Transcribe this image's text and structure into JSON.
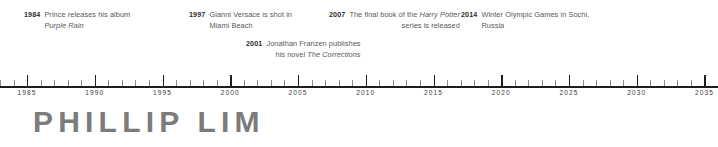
{
  "headline": "PHILLIP LIM",
  "colors": {
    "axis": "#1d1d1d",
    "major_tick": "#1d1d1d",
    "minor_tick": "#8c8c8c",
    "year_text": "#2b2b2b",
    "body_text": "#56585a",
    "headline": "#7b7b7b",
    "background": "#ffffff"
  },
  "annotations": [
    {
      "year": "1984",
      "line1": "Prince releases his album",
      "line2": "Purple Rain",
      "line2_italic": true,
      "align": "left",
      "row": 0,
      "x": 24,
      "y": 10
    },
    {
      "year": "1997",
      "line1": "Gianni Versace is shot in",
      "line2": "Miami Beach",
      "line2_italic": false,
      "align": "left",
      "row": 0,
      "x": 189,
      "y": 10
    },
    {
      "year": "2007",
      "line1": "The final book of the Harry Potter",
      "line1_italic_tail": "Harry Potter",
      "line2": "series is released",
      "line2_italic": false,
      "align": "center",
      "row": 0,
      "x": 329,
      "y": 10
    },
    {
      "year": "2014",
      "line1": "Winter Olympic Games in Sochi,",
      "line2": "Russia",
      "line2_italic": false,
      "align": "left",
      "row": 0,
      "x": 461,
      "y": 10
    },
    {
      "year": "2001",
      "line1": "Jonathan Franzen publishes",
      "line2": "his novel The Corrections",
      "line2_italic_tail": "The Corrections",
      "align": "center",
      "row": 1,
      "x": 246,
      "y": 39
    }
  ],
  "chart_data": {
    "type": "timeline",
    "title": "PHILLIP LIM",
    "xlabel": "",
    "axis_start": 1983,
    "axis_end": 2036,
    "xlim": [
      1983,
      2036
    ],
    "major_tick_interval": 5,
    "minor_tick_interval": 1,
    "grid": false,
    "legend": "none",
    "tick_labels": [
      "1985",
      "1990",
      "1995",
      "2000",
      "2005",
      "2010",
      "2015",
      "2020",
      "2025",
      "2030",
      "2035"
    ],
    "tick_values": [
      1985,
      1990,
      1995,
      2000,
      2005,
      2010,
      2015,
      2020,
      2025,
      2030,
      2035
    ],
    "events": [
      {
        "year": 1984,
        "label": "Prince releases his album Purple Rain"
      },
      {
        "year": 1997,
        "label": "Gianni Versace is shot in Miami Beach"
      },
      {
        "year": 2001,
        "label": "Jonathan Franzen publishes his novel The Corrections"
      },
      {
        "year": 2007,
        "label": "The final book of the Harry Potter series is released"
      },
      {
        "year": 2014,
        "label": "Winter Olympic Games in Sochi, Russia"
      }
    ]
  }
}
